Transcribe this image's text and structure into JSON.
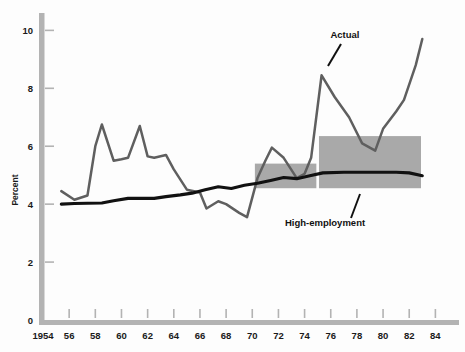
{
  "chart_data": {
    "type": "line",
    "title": "",
    "subtitle": "",
    "xlabel": "",
    "ylabel": "Percent",
    "xlim": [
      1954,
      1985.5
    ],
    "ylim": [
      0,
      10.6
    ],
    "grid": false,
    "legend_position": "inline-annotation",
    "y_ticks": [
      0,
      2,
      4,
      6,
      8,
      10
    ],
    "y_tick_labels": [
      "0",
      "2",
      "4",
      "6",
      "8",
      "10"
    ],
    "x_ticks": [
      1954,
      1956,
      1958,
      1960,
      1962,
      1964,
      1966,
      1968,
      1970,
      1972,
      1974,
      1976,
      1978,
      1980,
      1982,
      1984
    ],
    "x_tick_labels": [
      "1954",
      "56",
      "58",
      "60",
      "62",
      "64",
      "66",
      "68",
      "70",
      "72",
      "74",
      "76",
      "78",
      "80",
      "82",
      "84"
    ],
    "series": [
      {
        "name": "Actual",
        "color": "#5f5f5f",
        "x": [
          1955.4,
          1956.4,
          1957.4,
          1958.0,
          1958.5,
          1959.4,
          1960.0,
          1960.5,
          1961.4,
          1962.0,
          1962.5,
          1963.4,
          1964.0,
          1965.0,
          1966.0,
          1966.5,
          1967.4,
          1968.0,
          1969.0,
          1969.6,
          1970.4,
          1971.0,
          1971.5,
          1972.4,
          1973.4,
          1974.0,
          1974.5,
          1975.3,
          1976.3,
          1977.4,
          1978.4,
          1979.4,
          1980.0,
          1981.0,
          1981.6,
          1982.5,
          1983.0
        ],
        "values": [
          4.45,
          4.15,
          4.3,
          6.0,
          6.75,
          5.5,
          5.55,
          5.6,
          6.7,
          5.65,
          5.6,
          5.7,
          5.2,
          4.5,
          4.4,
          3.85,
          4.1,
          4.0,
          3.7,
          3.55,
          4.9,
          5.5,
          5.95,
          5.6,
          4.9,
          5.05,
          5.6,
          8.45,
          7.7,
          7.0,
          6.1,
          5.85,
          6.6,
          7.2,
          7.6,
          8.8,
          9.7
        ]
      },
      {
        "name": "High-employment",
        "color": "#111111",
        "x": [
          1955.4,
          1956.4,
          1957.4,
          1958.5,
          1959.4,
          1960.5,
          1961.4,
          1962.5,
          1963.4,
          1964.5,
          1965.4,
          1966.4,
          1967.4,
          1968.4,
          1969.4,
          1970.4,
          1971.4,
          1972.4,
          1973.4,
          1974.4,
          1975.4,
          1977.0,
          1979.0,
          1981.0,
          1982.0,
          1983.0
        ],
        "values": [
          4.0,
          4.02,
          4.03,
          4.04,
          4.12,
          4.2,
          4.2,
          4.2,
          4.26,
          4.32,
          4.38,
          4.5,
          4.6,
          4.54,
          4.65,
          4.72,
          4.82,
          4.92,
          4.88,
          4.98,
          5.08,
          5.1,
          5.1,
          5.1,
          5.08,
          4.98
        ]
      }
    ],
    "shaded_bands": [
      {
        "name": "band-1970-1975",
        "color": "#a9a9a9",
        "x_start": 1970.2,
        "x_end": 1974.9,
        "y_bottom": 4.55,
        "y_top": 5.4
      },
      {
        "name": "band-1975-1983",
        "color": "#a9a9a9",
        "x_start": 1975.1,
        "x_end": 1982.9,
        "y_bottom": 4.55,
        "y_top": 6.35
      }
    ],
    "annotations": [
      {
        "name": "actual-label",
        "text": "Actual",
        "label_x": 345,
        "label_y": 38,
        "leader": {
          "x1": 341,
          "y1": 44,
          "x2": 328,
          "y2": 66
        }
      },
      {
        "name": "high-employment-label",
        "text": "High-employment",
        "label_x": 325,
        "label_y": 226,
        "leader": {
          "x1": 351,
          "y1": 218,
          "x2": 360,
          "y2": 194
        }
      }
    ],
    "axis_style": {
      "axis_bar_color": "#b3b3b3",
      "tick_color": "#b3b3b3",
      "background": "#fdfdfd"
    }
  }
}
